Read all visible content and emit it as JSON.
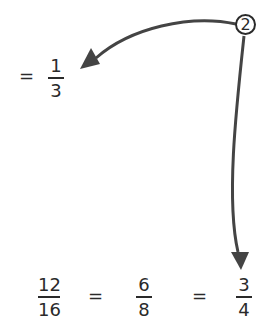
{
  "top_equation": {
    "equals": "=",
    "fraction": {
      "numerator": "1",
      "denominator": "3"
    }
  },
  "step_marker": {
    "label": "2"
  },
  "bottom_equation": {
    "fractions": [
      {
        "numerator": "12",
        "denominator": "16"
      },
      {
        "numerator": "6",
        "denominator": "8"
      },
      {
        "numerator": "3",
        "denominator": "4"
      }
    ],
    "equals": [
      "=",
      "="
    ]
  },
  "colors": {
    "ink": "#2a2a2a",
    "arrow": "#444444",
    "background": "#ffffff"
  }
}
